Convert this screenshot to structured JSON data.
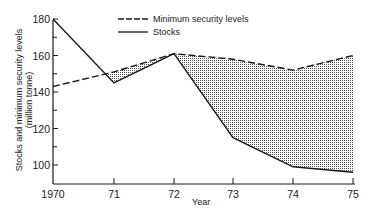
{
  "chart_data": {
    "type": "line",
    "title": "",
    "xlabel": "Year",
    "ylabel": "Stocks and minimum security levels (million tonne)",
    "ylabel_lines": [
      "Stocks and minimum security levels",
      "(million tonne)"
    ],
    "categories": [
      "1970",
      "71",
      "72",
      "73",
      "74",
      "75"
    ],
    "series": [
      {
        "name": "Minimum security levels",
        "style": "dashed",
        "values": [
          143,
          151,
          161,
          158,
          152,
          160
        ]
      },
      {
        "name": "Stocks",
        "style": "solid",
        "values": [
          180,
          145,
          161,
          115,
          99,
          96
        ]
      }
    ],
    "ylim": [
      90,
      180
    ],
    "yticks": [
      100,
      120,
      140,
      160,
      180
    ],
    "grid": false,
    "legend_position": "top-right",
    "annotations": [
      "Stippled area shows shortfall where stocks fall below minimum security levels"
    ]
  },
  "axis": {
    "x_tick_labels": [
      "1970",
      "71",
      "72",
      "73",
      "74",
      "75"
    ],
    "y_tick_labels": [
      "100",
      "120",
      "140",
      "160",
      "180"
    ],
    "xlabel": "Year",
    "ylabel_line1": "Stocks and minimum security levels",
    "ylabel_line2": "(million tonne)"
  },
  "legend": {
    "min_label": "Minimum security levels",
    "stocks_label": "Stocks"
  },
  "colors": {
    "line": "#1a1a1a",
    "stipple": "#555555",
    "background": "#ffffff"
  }
}
